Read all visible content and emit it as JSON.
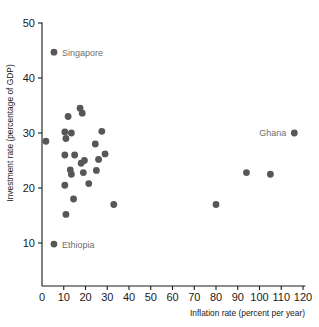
{
  "chart_data": {
    "type": "scatter",
    "title": "",
    "xlabel": "Inflation rate (percent per year)",
    "ylabel": "Investment rate (percentage of GDP)",
    "xlim": [
      0,
      120
    ],
    "ylim": [
      0,
      50
    ],
    "xticks": [
      0,
      10,
      20,
      30,
      40,
      50,
      60,
      70,
      80,
      90,
      100,
      110,
      120
    ],
    "xtick_labels": [
      "0",
      "10",
      "20",
      "30",
      "40",
      "50",
      "60",
      "70",
      "80",
      "90",
      "100",
      "110",
      "120"
    ],
    "yticks": [
      10,
      20,
      30,
      40,
      50
    ],
    "ytick_labels": [
      "10",
      "20",
      "30",
      "40",
      "50"
    ],
    "grid": false,
    "legend": "none",
    "marker_color": "#575757",
    "label_color": "#6f6f6f",
    "axis_color": "#1a1a1a",
    "points": [
      {
        "x": 5.5,
        "y": 44.7,
        "label": "Singapore",
        "label_position": "right"
      },
      {
        "x": 1.8,
        "y": 28.5,
        "label": "",
        "label_position": ""
      },
      {
        "x": 5.5,
        "y": 9.8,
        "label": "Ethiopia",
        "label_position": "right"
      },
      {
        "x": 116.0,
        "y": 30.0,
        "label": "Ghana",
        "label_position": "left"
      },
      {
        "x": 12.0,
        "y": 33.0,
        "label": "",
        "label_position": ""
      },
      {
        "x": 17.5,
        "y": 34.5,
        "label": "",
        "label_position": ""
      },
      {
        "x": 18.5,
        "y": 33.6,
        "label": "",
        "label_position": ""
      },
      {
        "x": 10.5,
        "y": 30.2,
        "label": "",
        "label_position": ""
      },
      {
        "x": 11.0,
        "y": 29.0,
        "label": "",
        "label_position": ""
      },
      {
        "x": 13.5,
        "y": 30.0,
        "label": "",
        "label_position": ""
      },
      {
        "x": 27.5,
        "y": 30.3,
        "label": "",
        "label_position": ""
      },
      {
        "x": 24.5,
        "y": 28.0,
        "label": "",
        "label_position": ""
      },
      {
        "x": 10.5,
        "y": 26.0,
        "label": "",
        "label_position": ""
      },
      {
        "x": 15.0,
        "y": 26.0,
        "label": "",
        "label_position": ""
      },
      {
        "x": 29.0,
        "y": 26.2,
        "label": "",
        "label_position": ""
      },
      {
        "x": 18.0,
        "y": 24.5,
        "label": "",
        "label_position": ""
      },
      {
        "x": 19.5,
        "y": 25.0,
        "label": "",
        "label_position": ""
      },
      {
        "x": 26.0,
        "y": 25.2,
        "label": "",
        "label_position": ""
      },
      {
        "x": 13.0,
        "y": 23.3,
        "label": "",
        "label_position": ""
      },
      {
        "x": 13.5,
        "y": 22.5,
        "label": "",
        "label_position": ""
      },
      {
        "x": 19.0,
        "y": 22.8,
        "label": "",
        "label_position": ""
      },
      {
        "x": 25.0,
        "y": 23.2,
        "label": "",
        "label_position": ""
      },
      {
        "x": 21.5,
        "y": 20.8,
        "label": "",
        "label_position": ""
      },
      {
        "x": 10.5,
        "y": 20.5,
        "label": "",
        "label_position": ""
      },
      {
        "x": 14.5,
        "y": 18.0,
        "label": "",
        "label_position": ""
      },
      {
        "x": 11.0,
        "y": 15.2,
        "label": "",
        "label_position": ""
      },
      {
        "x": 33.0,
        "y": 17.0,
        "label": "",
        "label_position": ""
      },
      {
        "x": 80.0,
        "y": 17.0,
        "label": "",
        "label_position": ""
      },
      {
        "x": 94.0,
        "y": 22.8,
        "label": "",
        "label_position": ""
      },
      {
        "x": 105.0,
        "y": 22.5,
        "label": "",
        "label_position": ""
      }
    ]
  }
}
